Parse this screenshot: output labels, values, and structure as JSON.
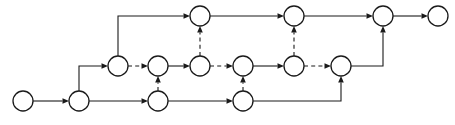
{
  "diagram": {
    "kind": "directed-graph",
    "title": "",
    "canvas": {
      "width": 455,
      "height": 125,
      "background": "#ffffff"
    },
    "style": {
      "node_radius": 10,
      "node_fill": "#ffffff",
      "node_stroke": "#1a1a1a",
      "node_stroke_width": 1.3,
      "edge_stroke": "#1a1a1a",
      "edge_stroke_width": 1.1,
      "dash_pattern": "4 3.2",
      "arrow_length": 6.5,
      "arrow_half_width": 2.8
    },
    "rows": {
      "top_y": 16,
      "middle_y": 66,
      "bottom_y": 101
    },
    "nodes": [
      {
        "id": "b0",
        "label": "",
        "x": 23,
        "y": 101,
        "row": "bottom"
      },
      {
        "id": "b1",
        "label": "",
        "x": 79,
        "y": 101,
        "row": "bottom"
      },
      {
        "id": "b2",
        "label": "",
        "x": 158,
        "y": 101,
        "row": "bottom"
      },
      {
        "id": "b3",
        "label": "",
        "x": 243,
        "y": 101,
        "row": "bottom"
      },
      {
        "id": "m0",
        "label": "",
        "x": 118,
        "y": 66,
        "row": "middle"
      },
      {
        "id": "m1",
        "label": "",
        "x": 158,
        "y": 66,
        "row": "middle"
      },
      {
        "id": "m2",
        "label": "",
        "x": 200,
        "y": 66,
        "row": "middle"
      },
      {
        "id": "m3",
        "label": "",
        "x": 243,
        "y": 66,
        "row": "middle"
      },
      {
        "id": "m4",
        "label": "",
        "x": 294,
        "y": 66,
        "row": "middle"
      },
      {
        "id": "m5",
        "label": "",
        "x": 341,
        "y": 66,
        "row": "middle"
      },
      {
        "id": "t0",
        "label": "",
        "x": 200,
        "y": 16,
        "row": "top"
      },
      {
        "id": "t1",
        "label": "",
        "x": 294,
        "y": 16,
        "row": "top"
      },
      {
        "id": "t2",
        "label": "",
        "x": 383,
        "y": 16,
        "row": "top"
      },
      {
        "id": "t3",
        "label": "",
        "x": 438,
        "y": 16,
        "row": "top"
      }
    ],
    "edges": [
      {
        "id": "e01",
        "from": "b0",
        "to": "b1",
        "style": "solid",
        "shape": "straight",
        "arrow": true
      },
      {
        "id": "e02",
        "from": "b1",
        "to": "b2",
        "style": "solid",
        "shape": "straight",
        "arrow": true
      },
      {
        "id": "e03",
        "from": "b2",
        "to": "b3",
        "style": "solid",
        "shape": "straight",
        "arrow": true
      },
      {
        "id": "e04",
        "from": "b1",
        "to": "m0",
        "style": "solid",
        "shape": "elbow-up-right",
        "arrow": true
      },
      {
        "id": "e05",
        "from": "m0",
        "to": "t0",
        "style": "solid",
        "shape": "elbow-up-right",
        "arrow": true
      },
      {
        "id": "e06",
        "from": "m0",
        "to": "m1",
        "style": "dashed",
        "shape": "straight",
        "arrow": true
      },
      {
        "id": "e07",
        "from": "m1",
        "to": "m2",
        "style": "solid",
        "shape": "straight",
        "arrow": true
      },
      {
        "id": "e08",
        "from": "m2",
        "to": "m3",
        "style": "dashed",
        "shape": "straight",
        "arrow": true
      },
      {
        "id": "e09",
        "from": "m3",
        "to": "m4",
        "style": "solid",
        "shape": "straight",
        "arrow": true
      },
      {
        "id": "e10",
        "from": "m4",
        "to": "m5",
        "style": "dashed",
        "shape": "straight",
        "arrow": true
      },
      {
        "id": "e11",
        "from": "b2",
        "to": "m1",
        "style": "dashed",
        "shape": "vertical",
        "arrow": true
      },
      {
        "id": "e12",
        "from": "b3",
        "to": "m3",
        "style": "dashed",
        "shape": "vertical",
        "arrow": true
      },
      {
        "id": "e13",
        "from": "m2",
        "to": "t0",
        "style": "dashed",
        "shape": "vertical",
        "arrow": true
      },
      {
        "id": "e14",
        "from": "m4",
        "to": "t1",
        "style": "dashed",
        "shape": "vertical",
        "arrow": true
      },
      {
        "id": "e15",
        "from": "t0",
        "to": "t1",
        "style": "solid",
        "shape": "straight",
        "arrow": true
      },
      {
        "id": "e16",
        "from": "t1",
        "to": "t2",
        "style": "solid",
        "shape": "straight",
        "arrow": true
      },
      {
        "id": "e17",
        "from": "t2",
        "to": "t3",
        "style": "solid",
        "shape": "straight",
        "arrow": true
      },
      {
        "id": "e18",
        "from": "b3",
        "to": "m5",
        "style": "solid",
        "shape": "elbow-right-up",
        "arrow": true,
        "corner_x": 341
      },
      {
        "id": "e19",
        "from": "m5",
        "to": "t2",
        "style": "solid",
        "shape": "elbow-right-up",
        "arrow": true,
        "corner_x": 383
      }
    ]
  }
}
